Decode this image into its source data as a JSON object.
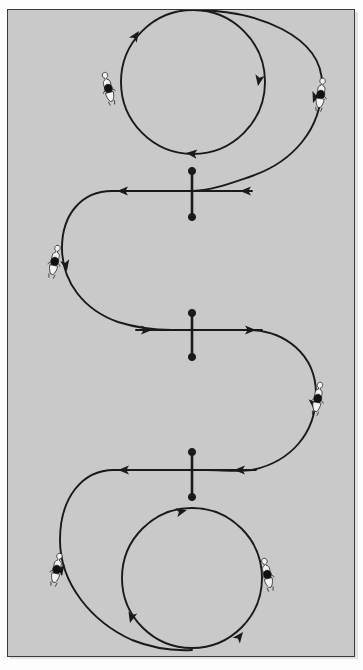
{
  "figure": {
    "title": "Serpentine with circles dressage pattern",
    "kind": "equestrian-arena-diagram",
    "background_color": "#c9c9c9",
    "ink_color": "#1a1a1a",
    "border_color": "#3a3a3a",
    "page_color": "#fdfdfd",
    "caption": ""
  },
  "arena": {
    "x": 7,
    "y": 9,
    "width": 348,
    "height": 648
  },
  "centerline_markers": [
    {
      "name": "marker-top",
      "x": 192,
      "y_top": 171,
      "y_bottom": 217,
      "dot_radius": 3.6
    },
    {
      "name": "marker-middle",
      "x": 192,
      "y_top": 313,
      "y_bottom": 357,
      "dot_radius": 3.6
    },
    {
      "name": "marker-bottom",
      "x": 192,
      "y_top": 452,
      "y_bottom": 497,
      "dot_radius": 3.6
    }
  ],
  "circles": [
    {
      "name": "circle-top",
      "cx": 193,
      "cy": 82,
      "r": 72,
      "direction": "clockwise"
    },
    {
      "name": "circle-bottom",
      "cx": 192,
      "cy": 578,
      "r": 70,
      "direction": "counter-clockwise"
    }
  ],
  "riders": [
    {
      "name": "rider-top-left",
      "x": 108,
      "y": 87,
      "rotation": -14,
      "scale": 1.0
    },
    {
      "name": "rider-top-right",
      "x": 321,
      "y": 93,
      "rotation": 8,
      "scale": 1.0
    },
    {
      "name": "rider-middle-left",
      "x": 55,
      "y": 260,
      "rotation": 12,
      "scale": 1.0
    },
    {
      "name": "rider-middle-right",
      "x": 318,
      "y": 397,
      "rotation": 10,
      "scale": 1.0
    },
    {
      "name": "rider-bottom-left",
      "x": 57,
      "y": 568,
      "rotation": 12,
      "scale": 1.0
    },
    {
      "name": "rider-bottom-right",
      "x": 267,
      "y": 573,
      "rotation": -12,
      "scale": 1.0
    }
  ],
  "arrowheads": [
    {
      "name": "arrow-top-circle-upper-left",
      "x": 140,
      "y": 32,
      "angle": -58
    },
    {
      "name": "arrow-top-circle-right",
      "x": 255,
      "y": 76,
      "angle": 96
    },
    {
      "name": "arrow-top-circle-bottom",
      "x": 196,
      "y": 152,
      "angle": 186
    },
    {
      "name": "arrow-outer-top-right",
      "x": 312,
      "y": 99,
      "angle": 108
    },
    {
      "name": "arrow-cross-top-left",
      "x": 122,
      "y": 192,
      "angle": 182
    },
    {
      "name": "arrow-cross-top-right",
      "x": 243,
      "y": 191,
      "angle": 182
    },
    {
      "name": "arrow-loop-left-upper",
      "x": 68,
      "y": 266,
      "angle": 12
    },
    {
      "name": "arrow-cross-mid-left",
      "x": 146,
      "y": 330,
      "angle": 2
    },
    {
      "name": "arrow-cross-mid-right",
      "x": 249,
      "y": 330,
      "angle": 2
    },
    {
      "name": "arrow-loop-right-lower",
      "x": 311,
      "y": 403,
      "angle": 110
    },
    {
      "name": "arrow-cross-bot-left",
      "x": 123,
      "y": 470,
      "angle": 182
    },
    {
      "name": "arrow-cross-bot-right",
      "x": 236,
      "y": 470,
      "angle": 182
    },
    {
      "name": "arrow-loop-left-lower",
      "x": 66,
      "y": 570,
      "angle": 12
    },
    {
      "name": "arrow-bottom-circle-top",
      "x": 192,
      "y": 510,
      "angle": -72
    },
    {
      "name": "arrow-bottom-circle-left",
      "x": 132,
      "y": 621,
      "angle": 128
    },
    {
      "name": "arrow-bottom-circle-right",
      "x": 242,
      "y": 628,
      "angle": -52
    }
  ],
  "paths": [
    {
      "name": "path-top-circle",
      "d": "M 193 10 A 72 72 0 1 1 192.9 10"
    },
    {
      "name": "path-main-serpentine",
      "d": "M 193 10 C 262 10 322 38 322 82 C 322 126 290 160 250 175 C 232 182 215 190 192 191 L 122 191 C 90 191 66 216 66 248 C 66 282 92 308 126 310 L 192 330 L 250 330 C 286 330 316 358 316 394 C 316 432 288 464 250 469 L 123 469 C 86 469 64 500 64 540 C 64 578 92 612 128 628 C 152 638 170 646 192 648"
    },
    {
      "name": "path-bottom-circle",
      "d": "M 192 508 A 70 70 0 1 1 191.9 508"
    }
  ]
}
